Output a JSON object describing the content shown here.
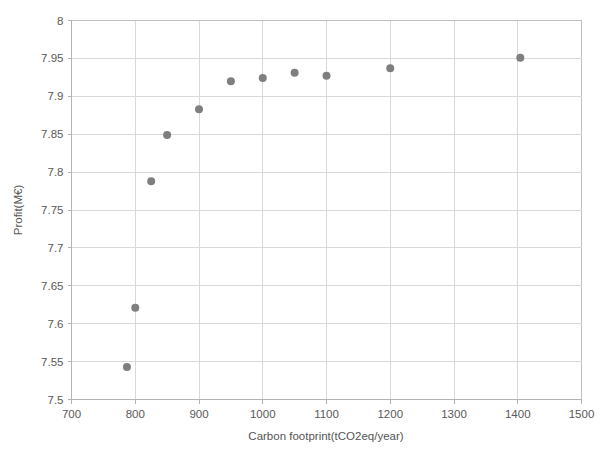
{
  "chart_data": {
    "type": "scatter",
    "title": "",
    "xlabel": "Carbon footprint(tCO2eq/year)",
    "ylabel": "Profit(M€)",
    "xlim": [
      700,
      1500
    ],
    "ylim": [
      7.5,
      8
    ],
    "xticks": [
      700,
      800,
      900,
      1000,
      1100,
      1200,
      1300,
      1400,
      1500
    ],
    "xtick_labels": [
      "700",
      "800",
      "900",
      "1000",
      "1100",
      "1200",
      "1300",
      "1400",
      "1500"
    ],
    "yticks": [
      7.5,
      7.55,
      7.6,
      7.65,
      7.7,
      7.75,
      7.8,
      7.85,
      7.9,
      7.95,
      8
    ],
    "ytick_labels": [
      "7.5",
      "7.55",
      "7.6",
      "7.65",
      "7.7",
      "7.75",
      "7.8",
      "7.85",
      "7.9",
      "7.95",
      "8"
    ],
    "grid": true,
    "legend": null,
    "marker_color": "#7f7f7f",
    "marker_size": 7,
    "series": [
      {
        "name": "Pareto front",
        "points": [
          {
            "x": 787,
            "y": 7.543
          },
          {
            "x": 800,
            "y": 7.621
          },
          {
            "x": 825,
            "y": 7.788
          },
          {
            "x": 850,
            "y": 7.849
          },
          {
            "x": 900,
            "y": 7.883
          },
          {
            "x": 950,
            "y": 7.92
          },
          {
            "x": 1000,
            "y": 7.924
          },
          {
            "x": 1050,
            "y": 7.931
          },
          {
            "x": 1100,
            "y": 7.927
          },
          {
            "x": 1200,
            "y": 7.937
          },
          {
            "x": 1404,
            "y": 7.951
          }
        ]
      }
    ]
  },
  "axes": {
    "x_title": "Carbon footprint(tCO2eq/year)",
    "y_title": "Profit(M€)"
  },
  "colors": {
    "marker": "#7f7f7f",
    "grid": "#d9d9d9",
    "axis": "#b3b3b3",
    "text": "#595959",
    "background": "#ffffff"
  }
}
